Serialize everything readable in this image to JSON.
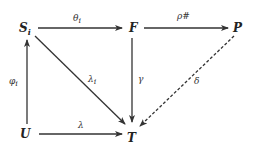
{
  "diagram": {
    "type": "commutative-diagram",
    "nodes": {
      "S": {
        "label": "S",
        "subscript": "i",
        "x": 25,
        "y": 28
      },
      "F": {
        "label": "F",
        "x": 133,
        "y": 28
      },
      "P": {
        "label": "P",
        "x": 238,
        "y": 28
      },
      "U": {
        "label": "U",
        "x": 25,
        "y": 132
      },
      "T": {
        "label": "T",
        "x": 132,
        "y": 132
      }
    },
    "edges": {
      "theta": {
        "from": "S",
        "to": "F",
        "label": "θ",
        "label_sub": "i",
        "style": "solid"
      },
      "rho": {
        "from": "F",
        "to": "P",
        "label": "ρ#",
        "style": "solid"
      },
      "phi": {
        "from": "U",
        "to": "S",
        "label": "φ",
        "label_sub": "i",
        "style": "solid"
      },
      "lambda_i": {
        "from": "S",
        "to": "T",
        "label": "λ",
        "label_sub": "i",
        "style": "solid"
      },
      "gamma": {
        "from": "F",
        "to": "T",
        "label": "γ",
        "style": "solid"
      },
      "delta": {
        "from": "P",
        "to": "T",
        "label": "δ",
        "style": "dashed"
      },
      "lambda": {
        "from": "U",
        "to": "T",
        "label": "λ",
        "style": "solid"
      }
    }
  }
}
